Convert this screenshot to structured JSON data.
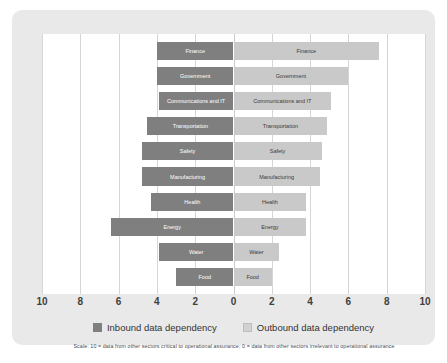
{
  "chart_data": {
    "type": "bar",
    "orientation": "horizontal",
    "style": "diverging-tornado",
    "title": "",
    "subtitle": "",
    "xlabel": "",
    "ylabel": "",
    "categories": [
      "Finance",
      "Government",
      "Communications and IT",
      "Transportation",
      "Safety",
      "Manufacturing",
      "Health",
      "Energy",
      "Water",
      "Food"
    ],
    "series": [
      {
        "name": "Inbound data dependency",
        "color": "#7f7f7f",
        "direction": "left",
        "values": [
          4.0,
          4.0,
          3.9,
          4.5,
          4.8,
          4.8,
          4.3,
          6.4,
          3.9,
          3.0
        ]
      },
      {
        "name": "Outbound data dependency",
        "color": "#c9c9c9",
        "direction": "right",
        "values": [
          7.6,
          6.0,
          5.1,
          4.9,
          4.6,
          4.5,
          3.8,
          3.8,
          2.4,
          2.0
        ]
      }
    ],
    "xlim": [
      -10,
      10
    ],
    "xticks": [
      -10,
      -8,
      -6,
      -4,
      -2,
      0,
      2,
      4,
      6,
      8,
      10
    ],
    "xtick_labels": [
      "10",
      "8",
      "6",
      "4",
      "2",
      "0",
      "2",
      "4",
      "6",
      "8",
      "10"
    ],
    "grid": true,
    "legend_position": "bottom"
  },
  "legend": {
    "inbound_label": "Inbound data dependency",
    "outbound_label": "Outbound data dependency"
  },
  "footnote": "Scale: 10 = data from other sectors critical to operational assurance; 0 = data from other sectors irrelevant to operational assurance",
  "colors": {
    "inbound": "#7f7f7f",
    "outbound": "#c9c9c9",
    "card_background": "#e9e9e9",
    "plot_background": "#ffffff",
    "gridline": "#d6d6d6"
  }
}
